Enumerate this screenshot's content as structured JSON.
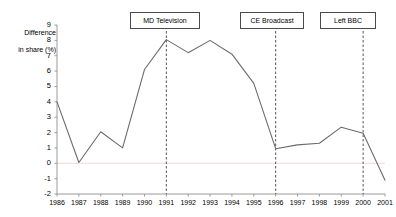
{
  "chart_data": {
    "type": "line",
    "title": "",
    "xlabel": "",
    "ylabel": "Difference\nin share (%)",
    "ylabel_line1": "Difference",
    "ylabel_line2": "in share (%)",
    "categories": [
      "1986",
      "1987",
      "1988",
      "1989",
      "1990",
      "1991",
      "1992",
      "1993",
      "1994",
      "1995",
      "1996",
      "1997",
      "1998",
      "1999",
      "2000",
      "2001"
    ],
    "values": [
      4.0,
      0.05,
      2.05,
      1.0,
      6.1,
      8.05,
      7.2,
      8.0,
      7.1,
      5.2,
      0.95,
      1.2,
      1.3,
      2.35,
      1.95,
      -1.1
    ],
    "ylim": [
      -2,
      9
    ],
    "ytick_labels": [
      "9",
      "8",
      "7",
      "6",
      "5",
      "4",
      "3",
      "2",
      "1",
      "0",
      "-1",
      "-2"
    ],
    "ytick_values": [
      9,
      8,
      7,
      6,
      5,
      4,
      3,
      2,
      1,
      0,
      -1,
      -2
    ],
    "grid": false,
    "zero_line": true,
    "legend_position": "none",
    "line_color": "#6b6b6b",
    "axis_color": "#9a9a9a",
    "zero_line_color": "#f2d7d7",
    "annotations": [
      {
        "label": "MD Television",
        "x_category": "1991",
        "box_left": 130,
        "box_top": 12,
        "box_width": 70
      },
      {
        "label": "CE Broadcast",
        "x_category": "1996",
        "box_left": 240,
        "box_top": 12,
        "box_width": 64
      },
      {
        "label": "Left BBC",
        "x_category": "2000",
        "box_left": 320,
        "box_top": 12,
        "box_width": 56
      }
    ]
  }
}
